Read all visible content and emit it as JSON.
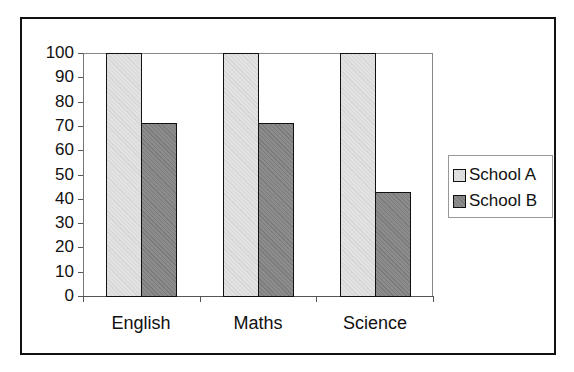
{
  "chart_data": {
    "type": "bar",
    "title": "",
    "xlabel": "",
    "ylabel": "",
    "categories": [
      "English",
      "Maths",
      "Science"
    ],
    "series": [
      {
        "name": "School A",
        "values": [
          100,
          100,
          100
        ],
        "color": "#e2e2e2"
      },
      {
        "name": "School B",
        "values": [
          71,
          71,
          43
        ],
        "color": "#8c8c8c"
      }
    ],
    "ylim": [
      0,
      100
    ],
    "yticks": [
      "0",
      "10",
      "20",
      "30",
      "40",
      "50",
      "60",
      "70",
      "80",
      "90",
      "100"
    ],
    "grid": false,
    "legend_position": "right"
  },
  "legend": {
    "items": [
      "School A",
      "School B"
    ]
  }
}
